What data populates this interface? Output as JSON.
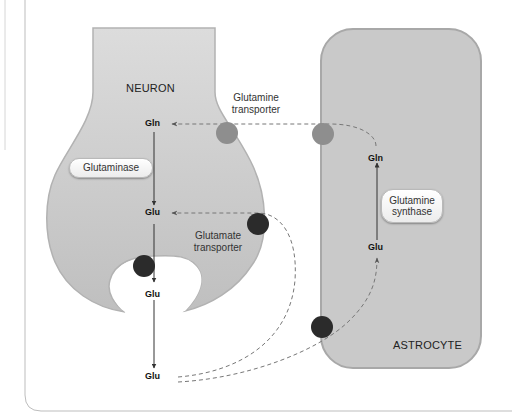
{
  "diagram": {
    "type": "glutamate-glutamine cycle",
    "cells": {
      "neuron": {
        "label": "NEURON"
      },
      "astrocyte": {
        "label": "ASTROCYTE"
      }
    },
    "molecules": {
      "neuron_gln": "Gln",
      "neuron_glu": "Glu",
      "vesicle_glu": "Glu",
      "synaptic_glu": "Glu",
      "astro_glu": "Glu",
      "astro_gln": "Gln"
    },
    "enzymes": {
      "glutaminase": "Glutaminase",
      "glutamine_synthase_line1": "Glutamine",
      "glutamine_synthase_line2": "synthase"
    },
    "transporters": {
      "glutamine_line1": "Glutamine",
      "glutamine_line2": "transporter",
      "glutamate_line1": "Glutamate",
      "glutamate_line2": "transporter"
    },
    "colors": {
      "cell_fill": "#c9c9c9",
      "cell_border": "#a8a8a8",
      "glutamine_transporter": "#8e8e8e",
      "glutamate_transporter": "#2b2b2b",
      "dashed_path": "#7a7a7a",
      "solid_arrow": "#333333"
    }
  }
}
